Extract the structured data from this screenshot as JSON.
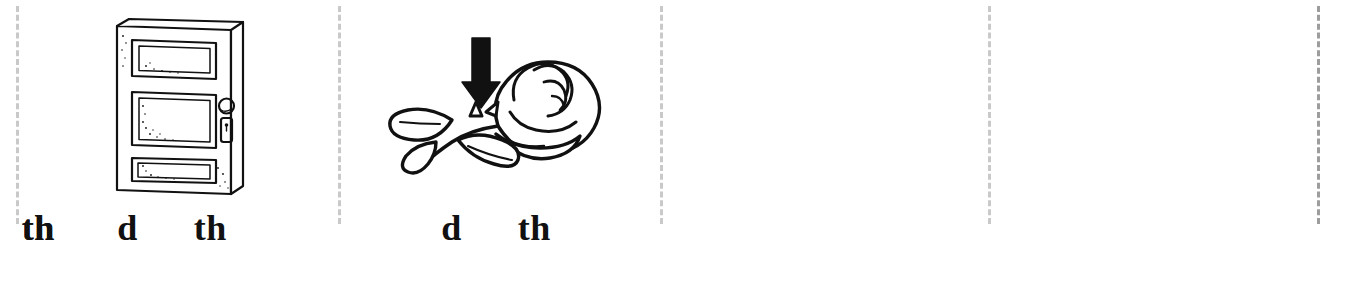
{
  "worksheet": {
    "background_color": "#ffffff",
    "ink_color": "#111111",
    "cut_line_color": "#c9c9c9",
    "cut_line_color_dark": "#9d9d9d",
    "layout": "four cut-apart phonics picture cards separated by vertical dashed lines"
  },
  "cards": [
    {
      "id": "card-1",
      "picture_name": "door",
      "picture_description": "line drawing of a three-panel door with a round knob and a keyhole escutcheon plate",
      "choices": [
        {
          "label": "d"
        },
        {
          "label": "th"
        }
      ]
    },
    {
      "id": "card-2",
      "picture_name": "thorn",
      "picture_description": "line drawing of a rose bloom on a leafy stem with a black arrow pointing down at the thorn",
      "choices": [
        {
          "label": "d"
        },
        {
          "label": "th"
        }
      ]
    },
    {
      "id": "card-3",
      "picture_name": "thirty",
      "picture_description": "the number 30 drawn as hollow outline numerals",
      "numerals": "30",
      "choices": [
        {
          "label": "d"
        },
        {
          "label": "th"
        }
      ]
    },
    {
      "id": "card-4",
      "picture_name": "dinosaur",
      "picture_description": "line drawing of a long-necked spotted dinosaur facing right",
      "choices": [
        {
          "label": "d"
        },
        {
          "label": "th"
        }
      ]
    }
  ],
  "cut_lines": [
    {
      "id": "cut-line-left",
      "x": 16,
      "shade": "light"
    },
    {
      "id": "cut-line-1-2",
      "x": 338,
      "shade": "light"
    },
    {
      "id": "cut-line-2-3",
      "x": 660,
      "shade": "light"
    },
    {
      "id": "cut-line-3-4",
      "x": 988,
      "shade": "light"
    },
    {
      "id": "cut-line-right",
      "x": 1317,
      "shade": "dark"
    }
  ]
}
